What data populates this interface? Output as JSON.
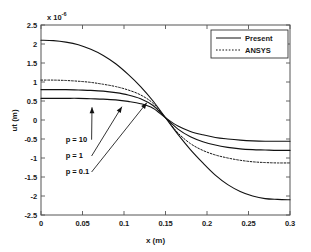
{
  "chart_data": {
    "type": "line",
    "title": "",
    "xlabel": "x (m)",
    "ylabel": "ut (m)",
    "y_exponent_label": "x 10",
    "y_exponent_value": "-6",
    "xlim": [
      0,
      0.3
    ],
    "ylim": [
      -2.5,
      2.5
    ],
    "xticks": [
      "0",
      "0.05",
      "0.1",
      "0.15",
      "0.2",
      "0.25",
      "0.3"
    ],
    "xtick_values": [
      0,
      0.05,
      0.1,
      0.15,
      0.2,
      0.25,
      0.3
    ],
    "yticks": [
      "2.5",
      "2",
      "1.5",
      "1",
      "0.5",
      "0",
      "-0.5",
      "-1",
      "-1.5",
      "-2",
      "-2.5"
    ],
    "ytick_values": [
      2.5,
      2,
      1.5,
      1,
      0.5,
      0,
      -0.5,
      -1,
      -1.5,
      -2,
      -2.5
    ],
    "grid": false,
    "legend_position": "top-right",
    "legend": [
      {
        "label": "Present",
        "style": "solid"
      },
      {
        "label": "ANSYS",
        "style": "dotted"
      }
    ],
    "x": [
      0,
      0.015,
      0.03,
      0.045,
      0.06,
      0.075,
      0.09,
      0.105,
      0.12,
      0.135,
      0.15,
      0.165,
      0.18,
      0.195,
      0.21,
      0.225,
      0.24,
      0.255,
      0.27,
      0.285,
      0.3
    ],
    "series": [
      {
        "name": "p = 0.1",
        "style": "solid",
        "annotation": "p = 0.1",
        "values": [
          2.1,
          2.09,
          2.05,
          1.98,
          1.86,
          1.7,
          1.48,
          1.2,
          0.88,
          0.5,
          0.06,
          -0.38,
          -0.78,
          -1.13,
          -1.45,
          -1.7,
          -1.88,
          -2.0,
          -2.07,
          -2.09,
          -2.1
        ]
      },
      {
        "name": "ANSYS",
        "style": "dotted",
        "annotation": "",
        "values": [
          1.05,
          1.05,
          1.04,
          1.02,
          0.99,
          0.94,
          0.88,
          0.79,
          0.66,
          0.44,
          0.06,
          -0.34,
          -0.62,
          -0.8,
          -0.92,
          -1.0,
          -1.06,
          -1.1,
          -1.12,
          -1.13,
          -1.13
        ]
      },
      {
        "name": "p = 1",
        "style": "solid",
        "annotation": "p = 1",
        "values": [
          0.8,
          0.8,
          0.8,
          0.79,
          0.78,
          0.76,
          0.72,
          0.66,
          0.56,
          0.38,
          0.06,
          -0.24,
          -0.44,
          -0.57,
          -0.66,
          -0.72,
          -0.76,
          -0.78,
          -0.79,
          -0.8,
          -0.8
        ]
      },
      {
        "name": "p = 10",
        "style": "solid",
        "annotation": "p = 10",
        "values": [
          0.57,
          0.57,
          0.57,
          0.57,
          0.56,
          0.55,
          0.53,
          0.49,
          0.43,
          0.31,
          0.06,
          -0.16,
          -0.3,
          -0.39,
          -0.46,
          -0.5,
          -0.53,
          -0.55,
          -0.56,
          -0.56,
          -0.56
        ]
      }
    ],
    "annotations": [
      {
        "label": "p = 10",
        "label_x": 0.0345,
        "label_y": -0.65,
        "tip_x": 0.0615,
        "tip_y": 0.44
      },
      {
        "label": "p = 1",
        "label_x": 0.0345,
        "label_y": -1.08,
        "tip_x": 0.0975,
        "tip_y": 0.455
      },
      {
        "label": "p = 0.1",
        "label_x": 0.0345,
        "label_y": -1.5,
        "tip_x": 0.1275,
        "tip_y": 0.56
      }
    ]
  }
}
